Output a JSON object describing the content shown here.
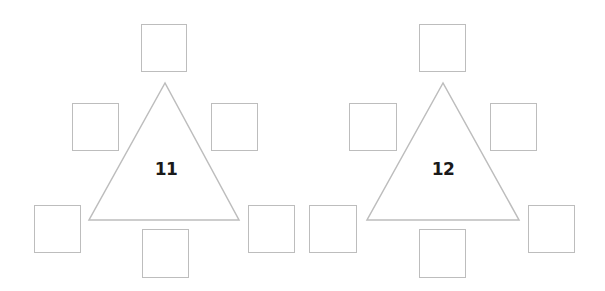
{
  "puzzles": [
    {
      "center_number": "11",
      "triangle": {
        "apex": [
          165,
          83
        ],
        "base_left": [
          89,
          220
        ],
        "base_right": [
          239,
          220
        ]
      },
      "number_pos": [
        166,
        169
      ],
      "boxes": [
        {
          "pos": "top",
          "x": 141,
          "y": 24,
          "w": 46,
          "h": 48,
          "value": ""
        },
        {
          "pos": "mid-left",
          "x": 72,
          "y": 103,
          "w": 47,
          "h": 48,
          "value": ""
        },
        {
          "pos": "mid-right",
          "x": 211,
          "y": 103,
          "w": 47,
          "h": 48,
          "value": ""
        },
        {
          "pos": "bottom-left",
          "x": 34,
          "y": 205,
          "w": 47,
          "h": 48,
          "value": ""
        },
        {
          "pos": "bottom-center",
          "x": 142,
          "y": 229,
          "w": 47,
          "h": 49,
          "value": ""
        },
        {
          "pos": "bottom-right",
          "x": 248,
          "y": 205,
          "w": 47,
          "h": 48,
          "value": ""
        }
      ]
    },
    {
      "center_number": "12",
      "triangle": {
        "apex": [
          443,
          83
        ],
        "base_left": [
          367,
          220
        ],
        "base_right": [
          519,
          220
        ]
      },
      "number_pos": [
        443,
        169
      ],
      "boxes": [
        {
          "pos": "top",
          "x": 419,
          "y": 24,
          "w": 47,
          "h": 48,
          "value": ""
        },
        {
          "pos": "mid-left",
          "x": 349,
          "y": 103,
          "w": 48,
          "h": 48,
          "value": ""
        },
        {
          "pos": "mid-right",
          "x": 490,
          "y": 103,
          "w": 47,
          "h": 48,
          "value": ""
        },
        {
          "pos": "bottom-left",
          "x": 309,
          "y": 205,
          "w": 48,
          "h": 48,
          "value": ""
        },
        {
          "pos": "bottom-center",
          "x": 419,
          "y": 229,
          "w": 47,
          "h": 49,
          "value": ""
        },
        {
          "pos": "bottom-right",
          "x": 528,
          "y": 205,
          "w": 47,
          "h": 48,
          "value": ""
        }
      ]
    }
  ],
  "colors": {
    "stroke": "#bdbdbd",
    "text": "#1a1a1a",
    "background": "#ffffff"
  }
}
